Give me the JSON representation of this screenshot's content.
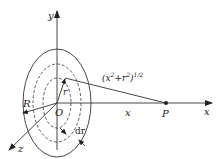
{
  "diagram": {
    "labels": {
      "y_axis": "y",
      "x_axis": "x",
      "z_axis": "z",
      "origin": "O",
      "outer_radius": "R",
      "inner_radius": "r",
      "ring_width": "dr",
      "distance_along_axis": "x",
      "point": "P",
      "slant_distance_base": "(x",
      "slant_sup1": "2",
      "slant_plus": "+r",
      "slant_sup2": "2",
      "slant_close": ")",
      "slant_sup3": "1/2"
    },
    "colors": {
      "stroke": "#222222",
      "background": "#ffffff"
    }
  }
}
